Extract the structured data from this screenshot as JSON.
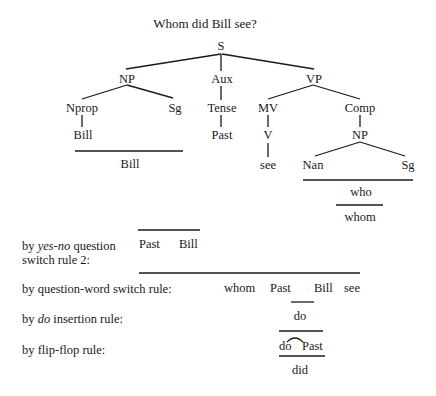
{
  "title": "Whom did Bill see?",
  "tree": {
    "S": "S",
    "NP": "NP",
    "Aux": "Aux",
    "VP": "VP",
    "Nprop": "Nprop",
    "Sg1": "Sg",
    "Tense": "Tense",
    "MV": "MV",
    "Comp": "Comp",
    "Bill_leaf": "Bill",
    "Past_leaf": "Past",
    "V": "V",
    "NP2": "NP",
    "see_leaf": "see",
    "Nan": "Nan",
    "Sg2": "Sg",
    "Bill_result": "Bill",
    "who": "who",
    "whom": "whom"
  },
  "rules": [
    {
      "label_pre": "by ",
      "label_italic": "yes-no",
      "label_post": " question",
      "label_line2": "switch rule 2:",
      "result": [
        "Past",
        "Bill"
      ]
    },
    {
      "label": "by question-word switch rule:",
      "result": [
        "whom",
        "Past",
        "Bill",
        "see"
      ]
    },
    {
      "label_pre": "by ",
      "label_italic": "do",
      "label_post": " insertion rule:",
      "result": [
        "do"
      ]
    },
    {
      "label": "by flip-flop rule:",
      "result": [
        "do",
        "Past"
      ],
      "output": "did"
    }
  ]
}
